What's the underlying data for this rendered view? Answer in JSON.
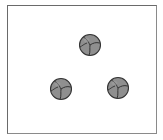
{
  "figure": {
    "border_color": "#6a6a6a",
    "cell_fill": "#8f8f8f",
    "cell_outline": "#333333",
    "clusters": [
      {
        "name": "top",
        "cx": 90,
        "cy": 45
      },
      {
        "name": "bottom-left",
        "cx": 61,
        "cy": 89
      },
      {
        "name": "bottom-right",
        "cx": 118,
        "cy": 88
      }
    ]
  }
}
